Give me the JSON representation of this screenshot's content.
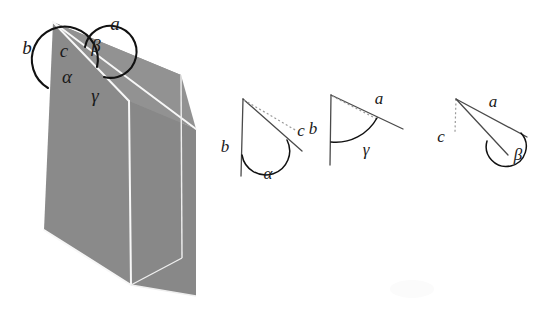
{
  "figure": {
    "background_color": "#ffffff",
    "solid_fill_color": "#8a8a8a",
    "solid_fill_color_dark": "#828282",
    "edge_line_color": "#f7f7f7",
    "arc_color": "#111111",
    "label_color": "#1a1a1a",
    "ray_color": "#4a4a4a",
    "dotted_line_color": "#9a9a9a"
  },
  "main_figure": {
    "name": "trihedral-angle-solid",
    "apex": {
      "x": 53,
      "y": 22
    },
    "labels": [
      {
        "key": "a",
        "text": "a",
        "x": 115,
        "y": 30,
        "name": "label-edge-a"
      },
      {
        "key": "b",
        "text": "b",
        "x": 27,
        "y": 54,
        "name": "label-edge-b"
      },
      {
        "key": "c",
        "text": "c",
        "x": 64,
        "y": 57,
        "name": "label-edge-c"
      },
      {
        "key": "beta",
        "text": "β",
        "x": 96,
        "y": 52,
        "name": "label-angle-beta"
      },
      {
        "key": "alpha",
        "text": "α",
        "x": 67,
        "y": 83,
        "name": "label-angle-alpha"
      },
      {
        "key": "gamma",
        "text": "γ",
        "x": 95,
        "y": 100,
        "name": "label-angle-gamma"
      }
    ]
  },
  "small_figures": [
    {
      "name": "planar-angle-alpha",
      "index": 1,
      "angle_symbol": "α",
      "ray_labels": [
        "b",
        "c"
      ],
      "labels": [
        {
          "key": "b",
          "text": "b",
          "x": 225,
          "y": 152,
          "name": "label-ray-b"
        },
        {
          "key": "c",
          "text": "c",
          "x": 300,
          "y": 135,
          "name": "label-ray-c"
        },
        {
          "key": "alpha",
          "text": "α",
          "x": 268,
          "y": 178,
          "name": "label-angle-alpha"
        }
      ]
    },
    {
      "name": "planar-angle-gamma",
      "index": 2,
      "angle_symbol": "γ",
      "ray_labels": [
        "b",
        "a"
      ],
      "labels": [
        {
          "key": "b",
          "text": "b",
          "x": 313,
          "y": 134,
          "name": "label-ray-b"
        },
        {
          "key": "a",
          "text": "a",
          "x": 379,
          "y": 105,
          "name": "label-ray-a"
        },
        {
          "key": "gamma",
          "text": "γ",
          "x": 365,
          "y": 152,
          "name": "label-angle-gamma"
        }
      ]
    },
    {
      "name": "planar-angle-beta",
      "index": 3,
      "angle_symbol": "β",
      "ray_labels": [
        "c",
        "a"
      ],
      "labels": [
        {
          "key": "c",
          "text": "c",
          "x": 440,
          "y": 141,
          "name": "label-ray-c"
        },
        {
          "key": "a",
          "text": "a",
          "x": 492,
          "y": 107,
          "name": "label-ray-a"
        },
        {
          "key": "beta",
          "text": "β",
          "x": 516,
          "y": 158,
          "name": "label-angle-beta"
        }
      ]
    }
  ]
}
